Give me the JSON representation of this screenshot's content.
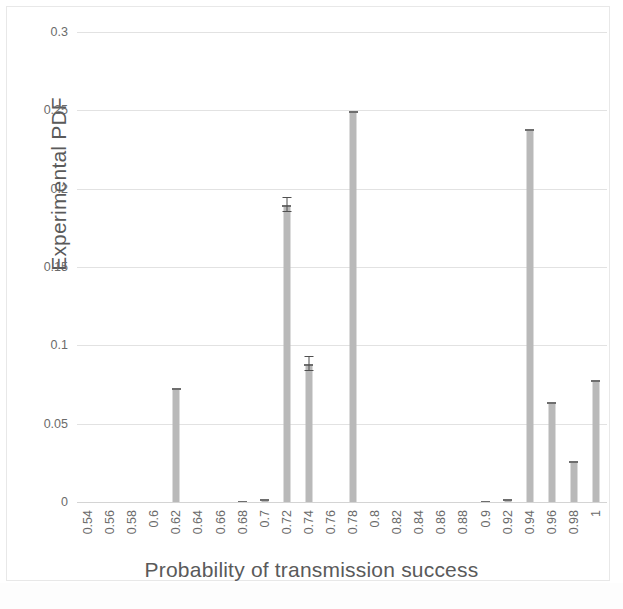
{
  "chart_data": {
    "type": "bar",
    "title": "",
    "xlabel": "Probability of transmission success",
    "ylabel": "Experimental PDF",
    "ylim": [
      0,
      0.3
    ],
    "ytick_labels": [
      "0",
      "0.05",
      "0.1",
      "0.15",
      "0.2",
      "0.25",
      "0.3"
    ],
    "ytick_values": [
      0,
      0.05,
      0.1,
      0.15,
      0.2,
      0.25,
      0.3
    ],
    "grid": true,
    "legend": "none",
    "bar_color": "#b9b9b9",
    "error_bar_color": "#4f4f4f",
    "categories": [
      "0.54",
      "0.56",
      "0.58",
      "0.6",
      "0.62",
      "0.64",
      "0.66",
      "0.68",
      "0.7",
      "0.72",
      "0.74",
      "0.76",
      "0.78",
      "0.8",
      "0.82",
      "0.84",
      "0.86",
      "0.88",
      "0.9",
      "0.92",
      "0.94",
      "0.96",
      "0.98",
      "1"
    ],
    "values": [
      0,
      0,
      0,
      0,
      0.0735,
      0,
      0,
      0.0015,
      0.0025,
      0.19,
      0.0885,
      0,
      0.25,
      0,
      0,
      0,
      0,
      0,
      0.0015,
      0.0025,
      0.239,
      0.0645,
      0.0265,
      0.0785
    ],
    "errors": [
      0,
      0,
      0,
      0,
      0,
      0,
      0,
      0,
      0,
      0.0045,
      0.0045,
      0,
      0,
      0,
      0,
      0,
      0,
      0,
      0,
      0,
      0,
      0,
      0,
      0
    ]
  }
}
